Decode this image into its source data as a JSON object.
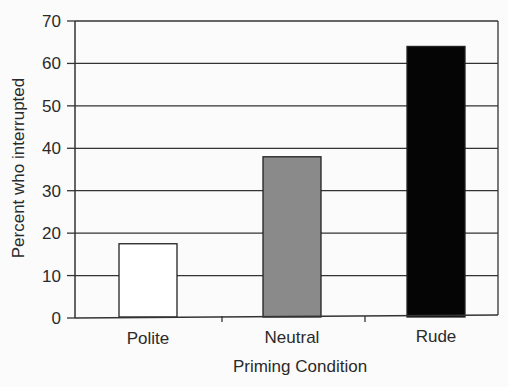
{
  "chart_data": {
    "type": "bar",
    "title": "",
    "xlabel": "Priming Condition",
    "ylabel": "Percent who interrupted",
    "categories": [
      "Polite",
      "Neutral",
      "Rude"
    ],
    "values": [
      17.5,
      38,
      64
    ],
    "bar_colors": [
      "#ffffff",
      "#8a8a8a",
      "#050505"
    ],
    "ylim": [
      0,
      70
    ],
    "yticks": [
      0,
      10,
      20,
      30,
      40,
      50,
      60,
      70
    ],
    "grid": "horizontal",
    "legend": null
  }
}
